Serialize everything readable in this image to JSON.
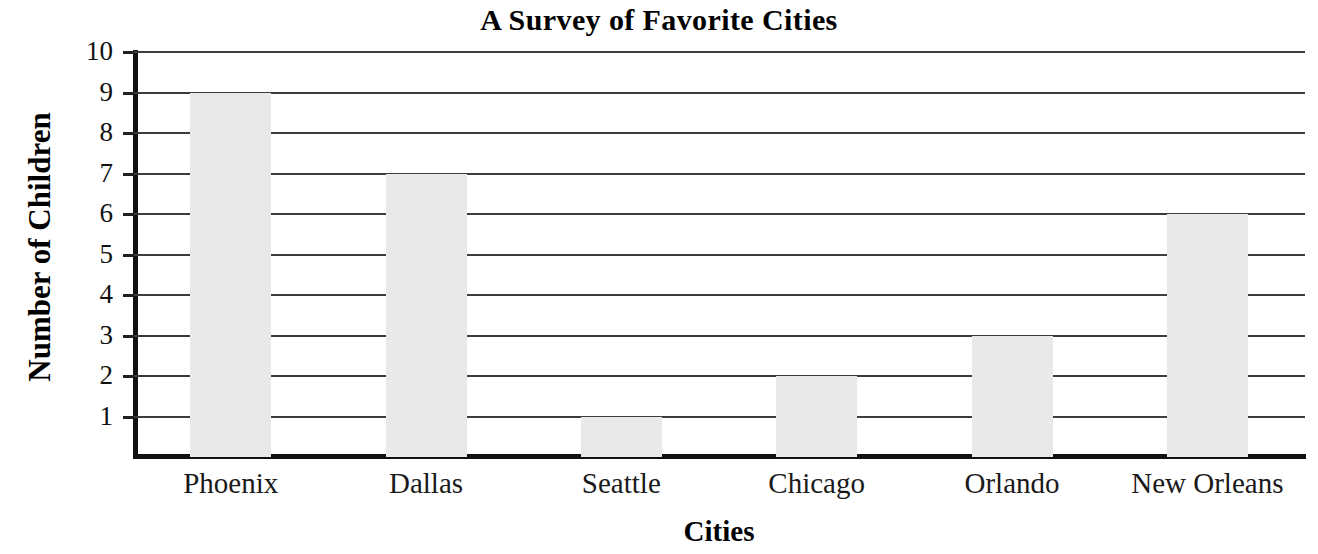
{
  "chart_data": {
    "type": "bar",
    "title": "A Survey of Favorite Cities",
    "xlabel": "Cities",
    "ylabel": "Number of Children",
    "categories": [
      "Phoenix",
      "Dallas",
      "Seattle",
      "Chicago",
      "Orlando",
      "New Orleans"
    ],
    "values": [
      9,
      7,
      1,
      2,
      3,
      6
    ],
    "ylim": [
      0,
      10
    ],
    "yticks": [
      1,
      2,
      3,
      4,
      5,
      6,
      7,
      8,
      9,
      10
    ],
    "ytick_labels": [
      "1",
      "2",
      "3",
      "4",
      "5",
      "6",
      "7",
      "8",
      "9",
      "10"
    ],
    "grid": true,
    "legend": "none",
    "bar_color": "#e9e9e9",
    "axis_color": "#111111",
    "gridline_color": "#3c3c3c",
    "background_color": "#ffffff"
  }
}
